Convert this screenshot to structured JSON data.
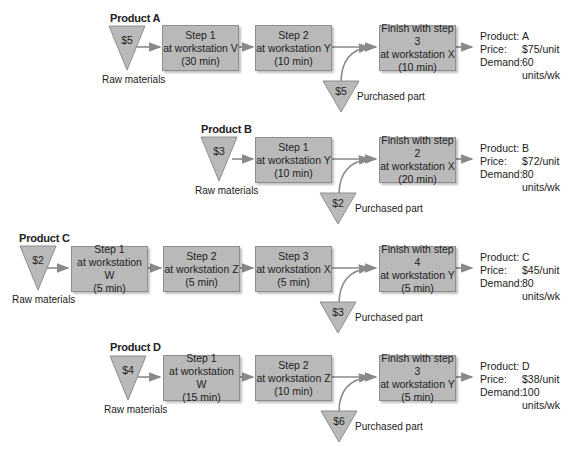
{
  "colors": {
    "box_fill": "#b9b9b9",
    "box_border": "#8e8e8e",
    "arrow": "#8a8a8a",
    "triangle_fill": "#b9b9b9"
  },
  "labels": {
    "raw_materials": "Raw materials",
    "purchased_part": "Purchased part",
    "product_key": "Product:",
    "price_key": "Price:",
    "demand_key": "Demand:"
  },
  "products": [
    {
      "title": "Product A",
      "raw_cost": "$5",
      "steps": [
        {
          "line1": "Step 1",
          "line2": "at workstation V",
          "line3": "(30 min)"
        },
        {
          "line1": "Step 2",
          "line2": "at workstation Y",
          "line3": "(10 min)"
        },
        {
          "line1": "Finish with step 3",
          "line2": "at workstation X",
          "line3": "(10 min)"
        }
      ],
      "purchased_cost": "$5",
      "info": {
        "product": "A",
        "price": "$75/unit",
        "demand": "60 units/wk"
      }
    },
    {
      "title": "Product B",
      "raw_cost": "$3",
      "steps": [
        {
          "line1": "Step 1",
          "line2": "at workstation Y",
          "line3": "(10 min)"
        },
        {
          "line1": "Finish with step 2",
          "line2": "at workstation X",
          "line3": "(20 min)"
        }
      ],
      "purchased_cost": "$2",
      "info": {
        "product": "B",
        "price": "$72/unit",
        "demand": "80 units/wk"
      }
    },
    {
      "title": "Product C",
      "raw_cost": "$2",
      "steps": [
        {
          "line1": "Step 1",
          "line2": "at workstation W",
          "line3": "(5 min)"
        },
        {
          "line1": "Step 2",
          "line2": "at workstation Z",
          "line3": "(5 min)"
        },
        {
          "line1": "Step 3",
          "line2": "at workstation X",
          "line3": "(5 min)"
        },
        {
          "line1": "Finish with step 4",
          "line2": "at workstation Y",
          "line3": "(5 min)"
        }
      ],
      "purchased_cost": "$3",
      "info": {
        "product": "C",
        "price": "$45/unit",
        "demand": "80 units/wk"
      }
    },
    {
      "title": "Product D",
      "raw_cost": "$4",
      "steps": [
        {
          "line1": "Step 1",
          "line2": "at workstation W",
          "line3": "(15 min)"
        },
        {
          "line1": "Step 2",
          "line2": "at workstation Z",
          "line3": "(10 min)"
        },
        {
          "line1": "Finish with step 3",
          "line2": "at workstation Y",
          "line3": "(5 min)"
        }
      ],
      "purchased_cost": "$6",
      "info": {
        "product": "D",
        "price": "$38/unit",
        "demand": "100 units/wk"
      }
    }
  ]
}
